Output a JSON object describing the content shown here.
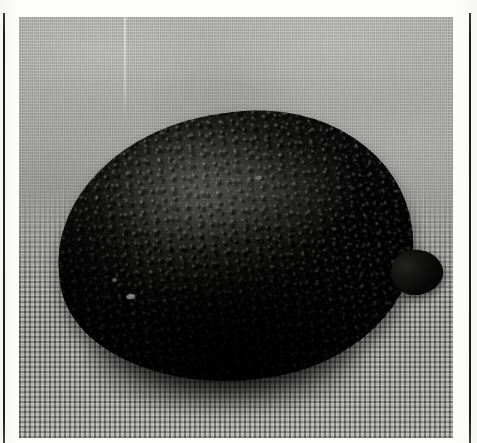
{
  "page": {
    "kind": "scanned-figure-page",
    "background_color": "#fdfdfc",
    "caption": "",
    "page_number": ""
  },
  "rules": {
    "color": "#1e1e1d",
    "left_label": "left-column-rule",
    "right_label": "right-column-rule"
  },
  "figure": {
    "label": "",
    "alt": "Black and white photograph of a dark, heavily pitted lemon resting on woven cloth",
    "medium": "halftone photographic plate",
    "tone": "monochrome"
  },
  "photo": {
    "subject": "pitted dark lemon",
    "subject_color": "#141413",
    "background_upper": "smooth draped gray fabric",
    "background_upper_color": "#b5b5b3",
    "background_lower": "coarse woven burlap grid",
    "background_lower_color": "#9a9a98",
    "surface_feature": "dense sunken pits and craters over the rind",
    "protrusion": "stylar nipple at right end",
    "shadow": "soft cast shadow beneath the fruit",
    "artifact": "faint vertical light scan streak, upper left"
  }
}
